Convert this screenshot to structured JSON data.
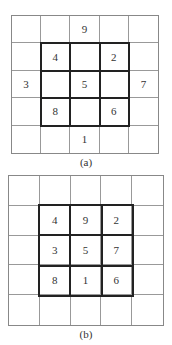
{
  "figures": [
    {
      "caption": "(a)",
      "cells": [
        [
          "",
          "",
          "9",
          "",
          ""
        ],
        [
          "",
          "4",
          "",
          "2",
          ""
        ],
        [
          "3",
          "",
          "5",
          "",
          "7"
        ],
        [
          "",
          "8",
          "",
          "6",
          ""
        ],
        [
          "",
          "",
          "1",
          "",
          ""
        ]
      ]
    },
    {
      "caption": "(b)",
      "cells": [
        [
          "",
          "",
          "",
          "",
          ""
        ],
        [
          "",
          "4",
          "9",
          "2",
          ""
        ],
        [
          "",
          "3",
          "5",
          "7",
          ""
        ],
        [
          "",
          "8",
          "1",
          "6",
          ""
        ],
        [
          "",
          "",
          "",
          "",
          ""
        ]
      ]
    }
  ]
}
